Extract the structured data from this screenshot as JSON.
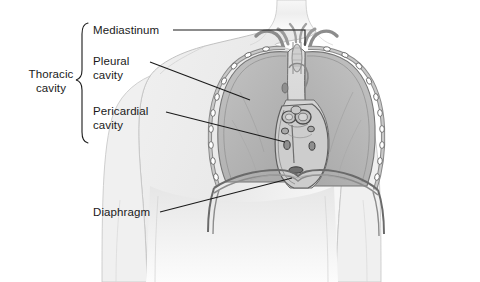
{
  "figure": {
    "type": "anatomical-illustration",
    "background_color": "#ffffff"
  },
  "labels": {
    "thoracic_cavity": "Thoracic\ncavity",
    "mediastinum": "Mediastinum",
    "pleural_cavity": "Pleural\ncavity",
    "pericardial_cavity": "Pericardial\ncavity",
    "diaphragm": "Diaphragm"
  },
  "colors": {
    "line": "#1a1a1a",
    "body_outline": "#b0b0b0",
    "body_fill": "#f2f2f2",
    "lung_fill": "#b9b9b9",
    "lung_outline": "#6e6e6e",
    "mediastinum_fill": "#d8d8d8",
    "heart_fill": "#cccccc",
    "rib_fill": "#ffffff",
    "rib_outline": "#555555",
    "vessel_fill": "#bdbdbd",
    "diaphragm_line": "#5a5a5a"
  },
  "structures": [
    {
      "name": "body-silhouette",
      "label": "Human upper torso outline"
    },
    {
      "name": "left-lung",
      "label": "Lung (viewer left)"
    },
    {
      "name": "right-lung",
      "label": "Lung (viewer right)"
    },
    {
      "name": "mediastinum-region",
      "label": "Mediastinum central compartment"
    },
    {
      "name": "pericardial-region",
      "label": "Pericardial cavity containing heart"
    },
    {
      "name": "diaphragm-arch",
      "label": "Diaphragm dome"
    },
    {
      "name": "rib-cage",
      "label": "Ribs along thoracic wall"
    },
    {
      "name": "great-vessels",
      "label": "Great vessels at thoracic inlet"
    }
  ],
  "leader_lines": [
    {
      "name": "mediastinum-leader",
      "shape": "elbow"
    },
    {
      "name": "pleural-cavity-leader",
      "shape": "straight"
    },
    {
      "name": "pericardial-cavity-leader",
      "shape": "straight"
    },
    {
      "name": "diaphragm-leader",
      "shape": "straight"
    },
    {
      "name": "thoracic-cavity-brace",
      "shape": "curly-brace"
    }
  ]
}
